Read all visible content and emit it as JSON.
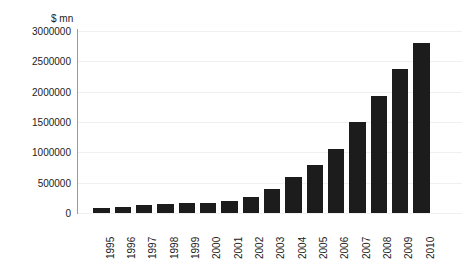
{
  "chart_data": {
    "type": "bar",
    "title": "",
    "subtitle": "",
    "xlabel": "",
    "ylabel": "$ mn",
    "unit_label": "$ mn",
    "categories": [
      "1995",
      "1996",
      "1997",
      "1998",
      "1999",
      "2000",
      "2001",
      "2002",
      "2003",
      "2004",
      "2005",
      "2006",
      "2007",
      "2008",
      "2009",
      "2010"
    ],
    "values": [
      80000,
      105000,
      135000,
      150000,
      160000,
      160000,
      195000,
      265000,
      390000,
      595000,
      790000,
      1050000,
      1500000,
      1930000,
      2380000,
      2800000
    ],
    "ylim": [
      0,
      3000000
    ],
    "ytick_values": [
      0,
      500000,
      1000000,
      1500000,
      2000000,
      2500000,
      3000000
    ],
    "ytick_labels": [
      "0",
      "500000",
      "1000000",
      "1500000",
      "2000000",
      "2500000",
      "3000000"
    ],
    "grid": true,
    "legend": false,
    "legend_position": "none",
    "bar_color": "#1c1c1c",
    "axis_color": "#9a9a9a",
    "grid_color": "#f0f0f0",
    "background_color": "#ffffff",
    "xtick_rotation": -90
  }
}
